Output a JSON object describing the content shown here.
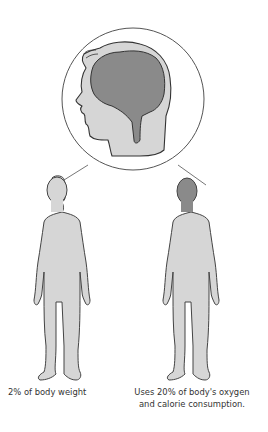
{
  "diagram": {
    "colors": {
      "outline": "#444444",
      "body_fill": "#d6d6d6",
      "brain_fill": "#8a8a8a",
      "circle_stroke": "#555555",
      "background": "#ffffff"
    },
    "callout": {
      "content": "head-profile-with-brain",
      "connects_to": [
        "left-figure-head",
        "right-figure-head"
      ]
    },
    "figures": [
      {
        "id": "left",
        "head_highlighted": false,
        "caption": "2% of body weight"
      },
      {
        "id": "right",
        "head_highlighted": true,
        "caption": "Uses 20% of body's oxygen and calorie consumption."
      }
    ]
  },
  "captions": {
    "left": "2% of body weight",
    "right_line1": "Uses 20% of body's oxygen",
    "right_line2": "and calorie consumption."
  }
}
